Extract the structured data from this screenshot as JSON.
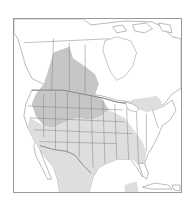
{
  "map": {
    "title": "",
    "region": "North America",
    "type": "species range map",
    "colors": {
      "background": "#ffffff",
      "frame": "#9a9a9a",
      "land": "#ffffff",
      "outline": "#8c8c8c",
      "range_primary": "#c6c6c6",
      "range_secondary": "#dedede"
    },
    "legend": []
  }
}
